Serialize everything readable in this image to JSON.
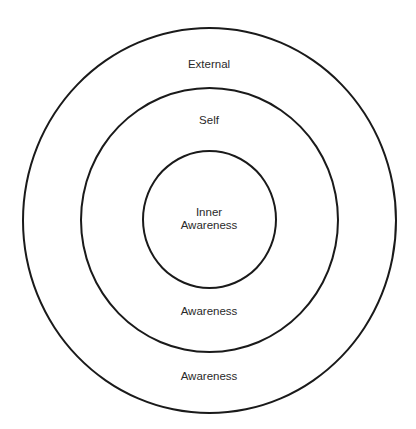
{
  "diagram": {
    "title": "",
    "rings": [
      {
        "id": "outer",
        "label_top": "External",
        "label_bottom": "Awareness"
      },
      {
        "id": "middle",
        "label_top": "Self",
        "label_bottom": "Awareness"
      },
      {
        "id": "inner",
        "label_line1": "Inner",
        "label_line2": "Awareness"
      }
    ],
    "stroke_color": "#1a1a1a",
    "text_color": "#2a2a2a"
  }
}
